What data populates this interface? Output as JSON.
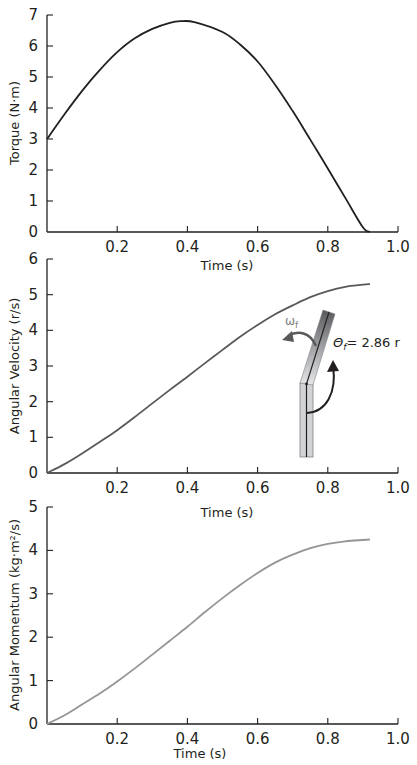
{
  "chart_data": [
    {
      "type": "line",
      "id": "torque",
      "title": "",
      "xlabel": "Time (s)",
      "ylabel": "Torque (N·m)",
      "xlim": [
        0,
        1.0
      ],
      "ylim": [
        0,
        7
      ],
      "xticks": [
        "0.2",
        "0.4",
        "0.6",
        "0.8",
        "1.0"
      ],
      "yticks": [
        "0",
        "1",
        "2",
        "3",
        "4",
        "5",
        "6",
        "7"
      ],
      "grid": false,
      "line_color": "#231f20",
      "series": [
        {
          "name": "Torque",
          "x": [
            0,
            0.05,
            0.1,
            0.15,
            0.2,
            0.25,
            0.3,
            0.35,
            0.38,
            0.42,
            0.5,
            0.55,
            0.6,
            0.65,
            0.7,
            0.75,
            0.8,
            0.85,
            0.9,
            0.92
          ],
          "y": [
            3.0,
            3.8,
            4.55,
            5.22,
            5.8,
            6.25,
            6.55,
            6.75,
            6.8,
            6.77,
            6.45,
            6.05,
            5.5,
            4.75,
            3.9,
            2.98,
            2.05,
            1.1,
            0.15,
            0.0
          ]
        }
      ]
    },
    {
      "type": "line",
      "id": "angular-velocity",
      "title": "",
      "xlabel": "Time (s)",
      "ylabel": "Angular Velocity (r/s)",
      "xlim": [
        0,
        1.0
      ],
      "ylim": [
        0,
        6
      ],
      "xticks": [
        "0.2",
        "0.4",
        "0.6",
        "0.8",
        "1.0"
      ],
      "yticks": [
        "0",
        "1",
        "2",
        "3",
        "4",
        "5",
        "6"
      ],
      "grid": false,
      "line_color": "#58595b",
      "series": [
        {
          "name": "Angular Velocity",
          "x": [
            0,
            0.05,
            0.1,
            0.15,
            0.2,
            0.25,
            0.3,
            0.35,
            0.4,
            0.45,
            0.5,
            0.55,
            0.6,
            0.65,
            0.7,
            0.75,
            0.8,
            0.85,
            0.9,
            0.92
          ],
          "y": [
            0,
            0.25,
            0.55,
            0.87,
            1.2,
            1.57,
            1.95,
            2.33,
            2.7,
            3.08,
            3.45,
            3.82,
            4.15,
            4.45,
            4.7,
            4.93,
            5.1,
            5.22,
            5.28,
            5.3
          ]
        }
      ],
      "annotations": {
        "omega_label": "ω",
        "omega_sub": "f",
        "theta_label": "Θ",
        "theta_sub": "f",
        "theta_value": "= 2.86 r"
      }
    },
    {
      "type": "line",
      "id": "angular-momentum",
      "title": "",
      "xlabel": "Time (s)",
      "ylabel": "Angular Momentum (kg·m²/s)",
      "xlim": [
        0,
        1.0
      ],
      "ylim": [
        0,
        5
      ],
      "xticks": [
        "0.2",
        "0.4",
        "0.6",
        "0.8",
        "1.0"
      ],
      "yticks": [
        "0",
        "1",
        "2",
        "3",
        "4",
        "5"
      ],
      "grid": false,
      "line_color": "#939598",
      "series": [
        {
          "name": "Angular Momentum",
          "x": [
            0,
            0.05,
            0.1,
            0.15,
            0.2,
            0.25,
            0.3,
            0.35,
            0.4,
            0.45,
            0.5,
            0.55,
            0.6,
            0.65,
            0.7,
            0.75,
            0.8,
            0.85,
            0.9,
            0.92
          ],
          "y": [
            0,
            0.2,
            0.45,
            0.7,
            0.98,
            1.28,
            1.6,
            1.92,
            2.24,
            2.58,
            2.9,
            3.2,
            3.48,
            3.72,
            3.9,
            4.05,
            4.15,
            4.21,
            4.24,
            4.25
          ]
        }
      ]
    }
  ]
}
